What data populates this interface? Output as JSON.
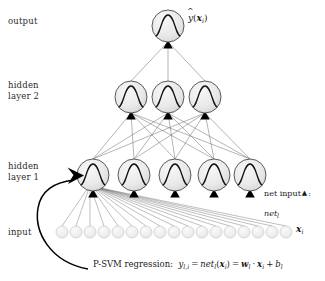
{
  "figure": {
    "background_color": "#ffffff",
    "node_fill": "#e8e8e8",
    "node_stroke": "#4a4a4a",
    "input_node_fill": "#efefef",
    "input_node_stroke": "#c8c8c8",
    "edge_color": "#555555",
    "marker_color": "#000000",
    "text_color": "#1a1a1a"
  },
  "labels": {
    "output": "output",
    "hidden_layer_2": "hidden\nlayer 2",
    "hidden_layer_1": "hidden\nlayer 1",
    "input": "input"
  },
  "annotations": {
    "output_symbol": {
      "y_hat": "y",
      "open_paren": "(",
      "x_bold": "x",
      "x_sub": "i",
      "close_paren": ")"
    },
    "input_symbol": {
      "x_bold": "x",
      "x_sub": "i"
    },
    "net_input": {
      "text_before": "net input",
      "triangle_glyph": "▲",
      "text_after": ":",
      "second_line_base": "net",
      "second_line_sub": "l"
    }
  },
  "caption": {
    "prefix": "P-SVM regression:",
    "lhs_base": "y",
    "lhs_sub": "l,i",
    "equals_1": "=",
    "net_base": "net",
    "net_sub": "l",
    "net_open": "(",
    "net_x": "x",
    "net_x_sub": "i",
    "net_close": ")",
    "equals_2": "=",
    "w_base": "w",
    "w_sub": "l",
    "dot": "·",
    "x_base": "x",
    "x_sub": "i",
    "plus": "+",
    "b_base": "b",
    "b_sub": "l"
  },
  "network": {
    "layers": [
      {
        "name": "output",
        "node_count": 1,
        "activation_glyph": "sigmoid",
        "y": 26,
        "radius": 16,
        "x_positions": [
          168
        ]
      },
      {
        "name": "hidden_layer_2",
        "node_count": 3,
        "activation_glyph": "sigmoid",
        "y": 97,
        "radius": 16,
        "x_positions": [
          131,
          168,
          205
        ]
      },
      {
        "name": "hidden_layer_1",
        "node_count": 5,
        "activation_glyph": "sigmoid",
        "y": 175,
        "radius": 16,
        "x_positions": [
          93,
          134,
          175,
          214,
          250
        ]
      },
      {
        "name": "input",
        "node_count": 17,
        "activation_glyph": "none",
        "y": 232,
        "radius": 6,
        "x_positions": [
          62,
          76,
          90,
          104,
          118,
          132,
          146,
          160,
          174,
          188,
          202,
          216,
          230,
          244,
          258,
          272,
          286
        ]
      }
    ],
    "net_input_markers": {
      "shape": "filled-triangle",
      "on_layers": [
        "hidden_layer_1",
        "hidden_layer_2",
        "output"
      ]
    },
    "highlighted_unit": {
      "layer": "hidden_layer_1",
      "index": 0,
      "description": "first hidden layer 1 unit, target of curved caption arrow"
    }
  }
}
